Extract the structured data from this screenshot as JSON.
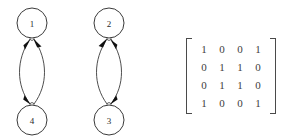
{
  "figure": {
    "graph": {
      "type": "directed-graph",
      "description": "Two disjoint components, each a pair of nodes joined by a bidirectional pair of curved arcs",
      "nodes": [
        {
          "id": "n1",
          "label": "1",
          "cx": 32,
          "cy": 23,
          "r": 15
        },
        {
          "id": "n4",
          "label": "4",
          "cx": 32,
          "cy": 120,
          "r": 15
        },
        {
          "id": "n2",
          "label": "2",
          "cx": 109,
          "cy": 23,
          "r": 15
        },
        {
          "id": "n3",
          "label": "3",
          "cx": 109,
          "cy": 120,
          "r": 15
        }
      ],
      "edges": [
        {
          "from": "1",
          "to": "4"
        },
        {
          "from": "4",
          "to": "1"
        },
        {
          "from": "2",
          "to": "3"
        },
        {
          "from": "3",
          "to": "2"
        }
      ]
    },
    "matrix": {
      "name": "adjacency-matrix",
      "rows": 4,
      "cols": 4,
      "bracket_style": "square",
      "values": [
        [
          "1",
          "0",
          "0",
          "1"
        ],
        [
          "0",
          "1",
          "1",
          "0"
        ],
        [
          "0",
          "1",
          "1",
          "0"
        ],
        [
          "1",
          "0",
          "0",
          "1"
        ]
      ]
    }
  },
  "colors": {
    "background": "#ffffff",
    "ink": "#3a3a3a",
    "matrix_ink": "#3d3d3d",
    "arrow_fill": "#111111"
  }
}
